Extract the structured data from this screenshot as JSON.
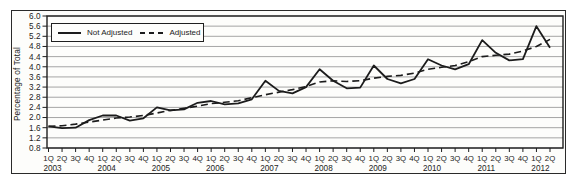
{
  "chart_data": {
    "type": "line",
    "title": "",
    "ylabel": "Percentage of Total",
    "xlabel": "",
    "ylim": [
      0.8,
      6.0
    ],
    "ytick_step": 0.4,
    "ytick_labels": [
      "6.0",
      "5.6",
      "5.2",
      "4.8",
      "4.4",
      "4.0",
      "3.6",
      "3.2",
      "2.8",
      "2.4",
      "2.0",
      "1.6",
      "1.2",
      "0.8"
    ],
    "grid": true,
    "legend_position": "top-left-inside",
    "colors": {
      "series_line": "#1c1c1c",
      "grid_line": "#9b9b9b",
      "plot_border": "#1f1f1f",
      "text": "#1c1c1c",
      "background": "#fdfdfb"
    },
    "x_quarter_labels": [
      "1Q",
      "2Q",
      "3Q",
      "4Q",
      "1Q",
      "2Q",
      "3Q",
      "4Q",
      "1Q",
      "2Q",
      "3Q",
      "4Q",
      "1Q",
      "2Q",
      "3Q",
      "4Q",
      "1Q",
      "2Q",
      "3Q",
      "4Q",
      "1Q",
      "2Q",
      "3Q",
      "4Q",
      "1Q",
      "2Q",
      "3Q",
      "4Q",
      "1Q",
      "2Q",
      "3Q",
      "4Q",
      "1Q",
      "2Q",
      "3Q",
      "4Q",
      "1Q",
      "2Q"
    ],
    "year_labels": [
      "2003",
      "2004",
      "2005",
      "2006",
      "2007",
      "2008",
      "2009",
      "2010",
      "2011",
      "2012"
    ],
    "categories": [
      "1Q 2003",
      "2Q 2003",
      "3Q 2003",
      "4Q 2003",
      "1Q 2004",
      "2Q 2004",
      "3Q 2004",
      "4Q 2004",
      "1Q 2005",
      "2Q 2005",
      "3Q 2005",
      "4Q 2005",
      "1Q 2006",
      "2Q 2006",
      "3Q 2006",
      "4Q 2006",
      "1Q 2007",
      "2Q 2007",
      "3Q 2007",
      "4Q 2007",
      "1Q 2008",
      "2Q 2008",
      "3Q 2008",
      "4Q 2008",
      "1Q 2009",
      "2Q 2009",
      "3Q 2009",
      "4Q 2009",
      "1Q 2010",
      "2Q 2010",
      "3Q 2010",
      "4Q 2010",
      "1Q 2011",
      "2Q 2011",
      "3Q 2011",
      "4Q 2011",
      "1Q 2012",
      "2Q 2012"
    ],
    "series": [
      {
        "name": "Not Adjusted",
        "style": "solid",
        "values": [
          1.65,
          1.58,
          1.6,
          1.9,
          2.08,
          2.08,
          1.88,
          1.97,
          2.4,
          2.28,
          2.32,
          2.58,
          2.65,
          2.52,
          2.56,
          2.72,
          3.45,
          3.05,
          2.95,
          3.2,
          3.9,
          3.45,
          3.15,
          3.18,
          4.05,
          3.52,
          3.35,
          3.52,
          4.3,
          4.05,
          3.9,
          4.1,
          5.05,
          4.55,
          4.25,
          4.3,
          5.6,
          4.75
        ]
      },
      {
        "name": "Adjusted",
        "style": "dashed",
        "values": [
          1.65,
          1.68,
          1.74,
          1.82,
          1.9,
          1.98,
          2.02,
          2.08,
          2.18,
          2.28,
          2.36,
          2.45,
          2.55,
          2.6,
          2.66,
          2.78,
          2.9,
          3.0,
          3.1,
          3.22,
          3.4,
          3.45,
          3.42,
          3.45,
          3.55,
          3.62,
          3.66,
          3.75,
          3.9,
          3.98,
          4.05,
          4.2,
          4.4,
          4.45,
          4.5,
          4.62,
          4.8,
          5.08
        ]
      }
    ]
  }
}
